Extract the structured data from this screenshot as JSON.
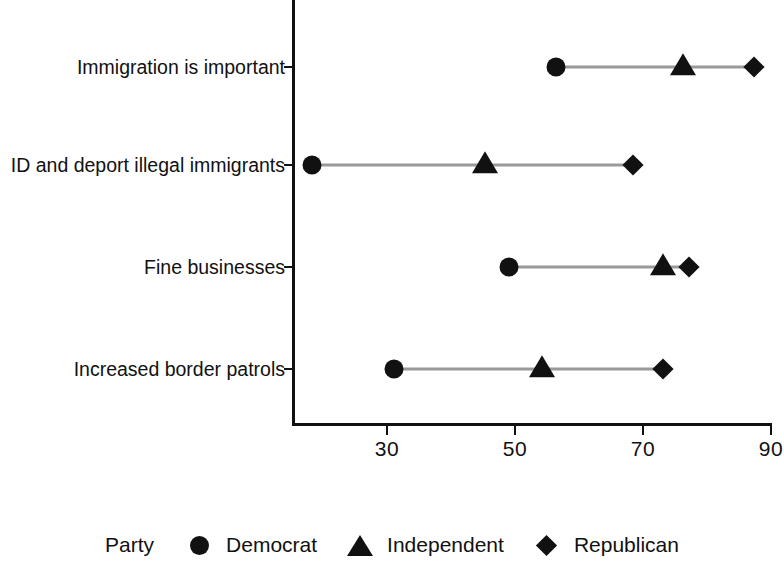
{
  "chart_data": {
    "type": "scatter",
    "subtype": "dumbbell-dot-plot",
    "title": "",
    "xlabel": "",
    "ylabel": "",
    "xlim": [
      18,
      90
    ],
    "xticks": [
      30,
      50,
      70,
      90
    ],
    "xtick_labels": [
      "30",
      "50",
      "70",
      "90"
    ],
    "grid": false,
    "legend_position": "bottom",
    "legend_title": "Party",
    "categories": [
      "Immigration is important",
      "ID and deport illegal immigrants",
      "Fine businesses",
      "Increased border patrols"
    ],
    "series": [
      {
        "name": "Democrat",
        "marker": "circle",
        "values": [
          56.4,
          18.3,
          49.0,
          31.1
        ]
      },
      {
        "name": "Independent",
        "marker": "triangle",
        "values": [
          76.3,
          45.3,
          73.1,
          54.2
        ]
      },
      {
        "name": "Republican",
        "marker": "diamond",
        "values": [
          87.4,
          68.4,
          77.2,
          73.1
        ]
      }
    ],
    "marker_color": "#111111",
    "connector_color": "#9a9a9a"
  },
  "axis": {
    "tick_labels": [
      "30",
      "50",
      "70",
      "90"
    ]
  },
  "categories": {
    "row0": "Immigration is important",
    "row1": "ID and deport illegal immigrants",
    "row2": "Fine businesses",
    "row3": "Increased border patrols"
  },
  "legend": {
    "title": "Party",
    "items": [
      {
        "label": "Democrat",
        "marker": "circle"
      },
      {
        "label": "Independent",
        "marker": "triangle"
      },
      {
        "label": "Republican",
        "marker": "diamond"
      }
    ]
  }
}
